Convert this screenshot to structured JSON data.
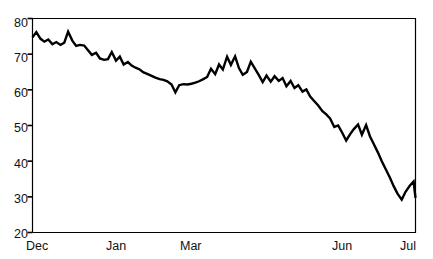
{
  "chart_data": {
    "type": "line",
    "title": "",
    "subtitle": "",
    "xlabel": "",
    "ylabel": "",
    "legend": [],
    "legend_position": "none",
    "grid": false,
    "xlim": [
      0,
      100
    ],
    "ylim": [
      20,
      80
    ],
    "yticks": [
      20,
      30,
      40,
      50,
      60,
      70,
      80
    ],
    "ytick_labels": [
      "20",
      "30",
      "40",
      "50",
      "60",
      "70",
      "80"
    ],
    "xticks": [
      0,
      20.5,
      45.5,
      84.5,
      100
    ],
    "xtick_labels": [
      "Dec",
      "Jan",
      "Mar",
      "Jun",
      "Jul"
    ],
    "line_color": "#000000",
    "line_width": 2.4,
    "axis_color": "#000000",
    "series": [
      {
        "name": "value",
        "x": [
          0.0,
          1.0,
          2.1,
          3.1,
          4.1,
          5.2,
          6.2,
          7.3,
          8.3,
          9.3,
          10.4,
          11.4,
          12.4,
          13.5,
          14.5,
          15.5,
          16.6,
          17.6,
          18.7,
          19.7,
          20.7,
          21.8,
          22.8,
          23.8,
          24.9,
          25.9,
          26.9,
          28.0,
          29.0,
          30.1,
          31.1,
          32.1,
          33.2,
          34.2,
          35.2,
          36.3,
          37.3,
          38.3,
          39.4,
          40.4,
          41.5,
          42.5,
          43.5,
          44.6,
          45.6,
          46.6,
          47.7,
          48.7,
          49.7,
          50.8,
          51.8,
          52.9,
          53.9,
          54.9,
          56.0,
          57.0,
          58.0,
          59.1,
          60.1,
          61.1,
          62.2,
          63.2,
          64.3,
          65.3,
          66.3,
          67.4,
          68.4,
          69.4,
          70.5,
          71.5,
          72.5,
          73.6,
          74.6,
          75.7,
          76.7,
          77.7,
          78.8,
          79.8,
          80.8,
          81.9,
          82.9,
          83.9,
          85.0,
          86.0,
          87.1,
          88.1,
          89.1,
          90.2,
          91.2,
          92.2,
          93.3,
          94.3,
          95.3,
          96.4,
          97.4,
          98.5,
          99.5,
          100.0
        ],
        "y": [
          74.7,
          76.2,
          74.3,
          73.5,
          74.1,
          72.8,
          73.4,
          72.6,
          73.2,
          76.3,
          73.8,
          72.3,
          72.6,
          72.4,
          71.1,
          69.8,
          70.4,
          68.8,
          68.4,
          68.6,
          70.6,
          68.2,
          69.3,
          67.1,
          67.8,
          66.8,
          66.2,
          65.7,
          64.9,
          64.4,
          63.9,
          63.4,
          63.0,
          62.8,
          62.4,
          61.5,
          59.3,
          61.3,
          61.6,
          61.5,
          61.7,
          62.0,
          62.4,
          63.0,
          63.6,
          65.9,
          64.4,
          67.1,
          65.7,
          69.3,
          67.0,
          69.4,
          66.1,
          64.2,
          65.0,
          67.9,
          66.1,
          64.1,
          62.2,
          64.0,
          62.3,
          63.8,
          62.5,
          63.3,
          61.0,
          62.5,
          60.5,
          61.3,
          59.5,
          60.1,
          58.1,
          56.8,
          55.6,
          54.0,
          53.1,
          52.0,
          49.6,
          50.0,
          48.1,
          45.8,
          47.5,
          49.0,
          50.3,
          47.4,
          50.1,
          47.0,
          44.8,
          42.4,
          40.0,
          37.8,
          35.4,
          33.0,
          30.9,
          29.2,
          31.4,
          33.1,
          34.3,
          29.7
        ]
      }
    ]
  },
  "axes": {
    "y_axis_name": "value-axis",
    "x_axis_name": "time-axis"
  }
}
